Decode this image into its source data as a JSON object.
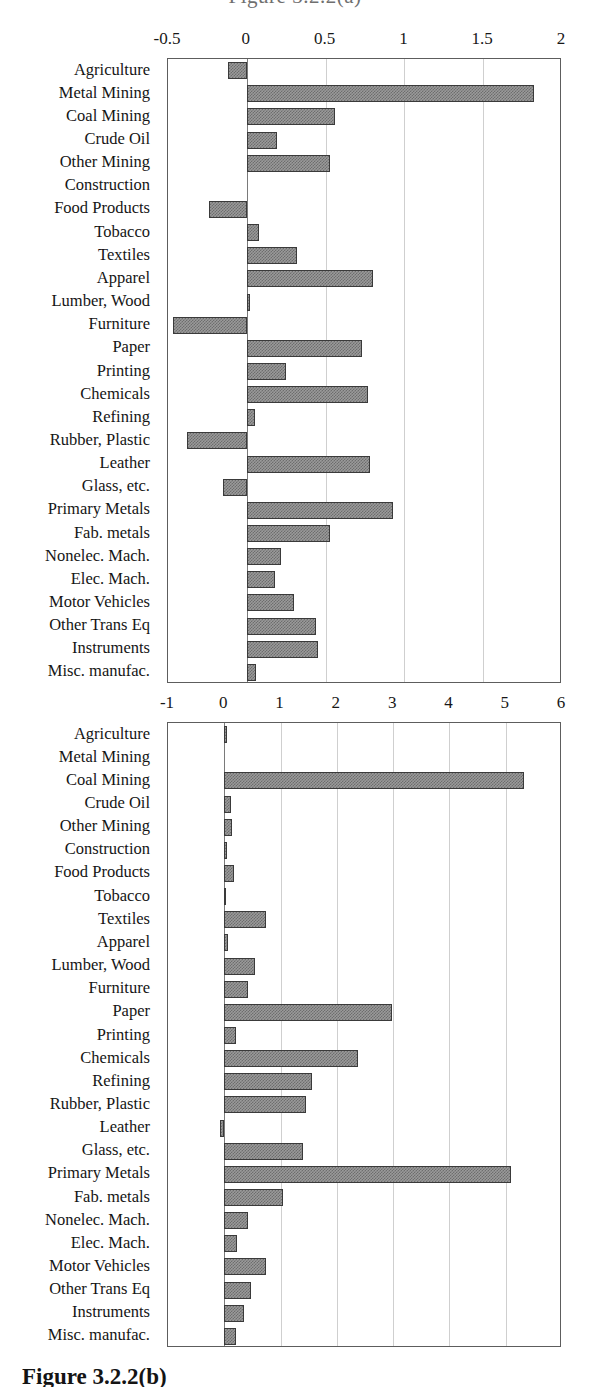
{
  "page": {
    "top_cut_text": "Figure 3.2.2(a)",
    "caption": "Figure 3.2.2(b)"
  },
  "categories": [
    "Agriculture",
    "Metal Mining",
    "Coal Mining",
    "Crude Oil",
    "Other Mining",
    "Construction",
    "Food Products",
    "Tobacco",
    "Textiles",
    "Apparel",
    "Lumber, Wood",
    "Furniture",
    "Paper",
    "Printing",
    "Chemicals",
    "Refining",
    "Rubber, Plastic",
    "Leather",
    "Glass, etc.",
    "Primary Metals",
    "Fab. metals",
    "Nonelec. Mach.",
    "Elec. Mach.",
    "Motor Vehicles",
    "Other Trans Eq",
    "Instruments",
    "Misc. manufac."
  ],
  "chart_data": [
    {
      "type": "bar",
      "id": "chart-top",
      "orientation": "horizontal",
      "title": "",
      "xlabel": "",
      "ylabel": "",
      "xlim": [
        -0.5,
        2
      ],
      "xticks": [
        "-0.5",
        "0",
        "0.5",
        "1",
        "1.5",
        "2"
      ],
      "xtick_values": [
        -0.5,
        0,
        0.5,
        1,
        1.5,
        2
      ],
      "grid": true,
      "legend": "none",
      "categories": [
        "Agriculture",
        "Metal Mining",
        "Coal Mining",
        "Crude Oil",
        "Other Mining",
        "Construction",
        "Food Products",
        "Tobacco",
        "Textiles",
        "Apparel",
        "Lumber, Wood",
        "Furniture",
        "Paper",
        "Printing",
        "Chemicals",
        "Refining",
        "Rubber, Plastic",
        "Leather",
        "Glass, etc.",
        "Primary Metals",
        "Fab. metals",
        "Nonelec. Mach.",
        "Elec. Mach.",
        "Motor Vehicles",
        "Other Trans Eq",
        "Instruments",
        "Misc. manufac."
      ],
      "values": [
        -0.12,
        1.82,
        0.56,
        0.19,
        0.53,
        0.0,
        -0.24,
        0.08,
        0.32,
        0.8,
        0.02,
        -0.47,
        0.73,
        0.25,
        0.77,
        0.05,
        -0.38,
        0.78,
        -0.15,
        0.93,
        0.53,
        0.22,
        0.18,
        0.3,
        0.44,
        0.45,
        0.06
      ]
    },
    {
      "type": "bar",
      "id": "chart-bottom",
      "orientation": "horizontal",
      "title": "",
      "xlabel": "",
      "ylabel": "",
      "xlim": [
        -1,
        6
      ],
      "xticks": [
        "-1",
        "0",
        "1",
        "2",
        "3",
        "4",
        "5",
        "6"
      ],
      "xtick_values": [
        -1,
        0,
        1,
        2,
        3,
        4,
        5,
        6
      ],
      "grid": true,
      "legend": "none",
      "categories": [
        "Agriculture",
        "Metal Mining",
        "Coal Mining",
        "Crude Oil",
        "Other Mining",
        "Construction",
        "Food Products",
        "Tobacco",
        "Textiles",
        "Apparel",
        "Lumber, Wood",
        "Furniture",
        "Paper",
        "Printing",
        "Chemicals",
        "Refining",
        "Rubber, Plastic",
        "Leather",
        "Glass, etc.",
        "Primary Metals",
        "Fab. metals",
        "Nonelec. Mach.",
        "Elec. Mach.",
        "Motor Vehicles",
        "Other Trans Eq",
        "Instruments",
        "Misc. manufac."
      ],
      "values": [
        0.04,
        0.0,
        5.32,
        0.12,
        0.14,
        0.04,
        0.17,
        0.03,
        0.75,
        0.06,
        0.55,
        0.42,
        2.98,
        0.2,
        2.38,
        1.55,
        1.45,
        -0.08,
        1.4,
        5.1,
        1.05,
        0.42,
        0.22,
        0.75,
        0.48,
        0.35,
        0.2
      ]
    }
  ]
}
